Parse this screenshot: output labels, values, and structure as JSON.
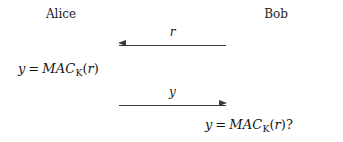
{
  "diagram": {
    "type": "challenge-response-authentication-protocol",
    "parties": {
      "left": "Alice",
      "right": "Bob"
    },
    "messages": [
      {
        "label": "r",
        "direction": "right-to-left",
        "from": "Bob",
        "to": "Alice"
      },
      {
        "label": "y",
        "direction": "left-to-right",
        "from": "Alice",
        "to": "Bob"
      }
    ],
    "expressions": {
      "alice": {
        "lhs": "y",
        "equals": "=",
        "function": "MAC",
        "subscript": "K",
        "open_paren": "(",
        "argument": "r",
        "close_paren": ")",
        "suffix": ""
      },
      "bob": {
        "lhs": "y",
        "equals": "=",
        "function": "MAC",
        "subscript": "K",
        "open_paren": "(",
        "argument": "r",
        "close_paren": ")",
        "suffix": "?"
      }
    },
    "colors": {
      "background": "#ffffff",
      "text": "#1a1a1a",
      "arrow": "#3a3a3a"
    }
  }
}
